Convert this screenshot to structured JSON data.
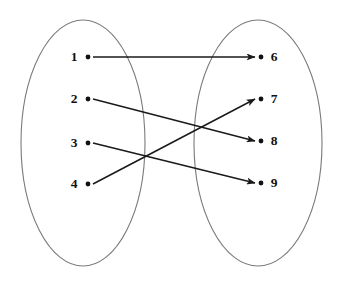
{
  "diagram": {
    "type": "mapping-diagram",
    "background_color": "#ffffff",
    "ellipse_stroke_color": "#7a7a7a",
    "edge_color": "#1a1a1a",
    "label_color": "#111111",
    "sets": [
      {
        "id": "domain",
        "name": "left-set",
        "ellipse": {
          "cx": 83,
          "cy": 143,
          "rx": 62,
          "ry": 123
        },
        "nodes": [
          {
            "id": "n1",
            "label": "1",
            "dot_x": 88,
            "dot_y": 57,
            "label_x": 74,
            "label_y": 57
          },
          {
            "id": "n2",
            "label": "2",
            "dot_x": 88,
            "dot_y": 99,
            "label_x": 74,
            "label_y": 99
          },
          {
            "id": "n3",
            "label": "3",
            "dot_x": 88,
            "dot_y": 143,
            "label_x": 74,
            "label_y": 143
          },
          {
            "id": "n4",
            "label": "4",
            "dot_x": 88,
            "dot_y": 184,
            "label_x": 74,
            "label_y": 184
          }
        ]
      },
      {
        "id": "codomain",
        "name": "right-set",
        "ellipse": {
          "cx": 258,
          "cy": 143,
          "rx": 64,
          "ry": 123
        },
        "nodes": [
          {
            "id": "n6",
            "label": "6",
            "dot_x": 261,
            "dot_y": 57,
            "label_x": 274,
            "label_y": 57
          },
          {
            "id": "n7",
            "label": "7",
            "dot_x": 261,
            "dot_y": 99,
            "label_x": 274,
            "label_y": 99
          },
          {
            "id": "n8",
            "label": "8",
            "dot_x": 261,
            "dot_y": 141,
            "label_x": 274,
            "label_y": 141
          },
          {
            "id": "n9",
            "label": "9",
            "dot_x": 261,
            "dot_y": 183,
            "label_x": 274,
            "label_y": 183
          }
        ]
      }
    ],
    "edges": [
      {
        "id": "e1",
        "from": "1",
        "to": "6",
        "x1": 93,
        "y1": 57,
        "x2": 255,
        "y2": 57
      },
      {
        "id": "e2",
        "from": "2",
        "to": "8",
        "x1": 93,
        "y1": 99,
        "x2": 255,
        "y2": 141
      },
      {
        "id": "e3",
        "from": "3",
        "to": "9",
        "x1": 93,
        "y1": 143,
        "x2": 255,
        "y2": 183
      },
      {
        "id": "e4",
        "from": "4",
        "to": "7",
        "x1": 93,
        "y1": 184,
        "x2": 255,
        "y2": 99
      }
    ]
  }
}
